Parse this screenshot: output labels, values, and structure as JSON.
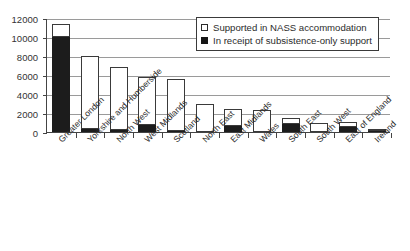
{
  "chart_data": {
    "type": "bar",
    "title": "",
    "xlabel": "",
    "ylabel": "",
    "ylim": [
      0,
      12000
    ],
    "ytick_step": 2000,
    "yticks": [
      "12000",
      "10000",
      "8000",
      "6000",
      "4000",
      "2000",
      "0"
    ],
    "grid": true,
    "stacked": true,
    "legend_position": "top-right",
    "categories": [
      "Greater London",
      "Yorkshire and Humberside",
      "North West",
      "West Midlands",
      "Scotland",
      "North East",
      "East Midlands",
      "Wales",
      "South East",
      "South West",
      "East of England",
      "Ireland"
    ],
    "series": [
      {
        "name": "In receipt of subsistence-only support",
        "color": "#1c1c1c",
        "values": [
          10000,
          300,
          200,
          700,
          100,
          0,
          600,
          0,
          800,
          0,
          500,
          60
        ]
      },
      {
        "name": "Supported in NASS accommodation",
        "color": "#ffffff",
        "values": [
          1400,
          7750,
          6650,
          5100,
          5500,
          3000,
          1850,
          2300,
          700,
          1000,
          600,
          40
        ]
      }
    ],
    "totals": [
      11400,
      8050,
      6850,
      5800,
      5600,
      3000,
      2450,
      2300,
      1500,
      1000,
      1100,
      100
    ]
  },
  "legend": {
    "items": [
      {
        "label": "Supported in NASS accommodation",
        "swatch": "white-square-icon"
      },
      {
        "label": "In receipt of subsistence-only support",
        "swatch": "black-square-icon"
      }
    ]
  }
}
